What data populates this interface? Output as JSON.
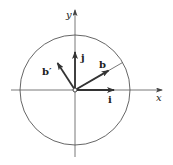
{
  "diagram": {
    "type": "vector-rotation",
    "axes": {
      "x_label": "x",
      "y_label": "y"
    },
    "circle": {
      "type": "unit-circle"
    },
    "vectors": [
      {
        "name": "i",
        "label": "i",
        "angle_deg": 0
      },
      {
        "name": "j",
        "label": "j",
        "angle_deg": 90
      },
      {
        "name": "b",
        "label": "b",
        "angle_deg": 30
      },
      {
        "name": "b-prime",
        "label": "b′",
        "angle_deg": 120
      }
    ]
  },
  "colors": {
    "stroke": "#333333",
    "thin": "#555555"
  }
}
